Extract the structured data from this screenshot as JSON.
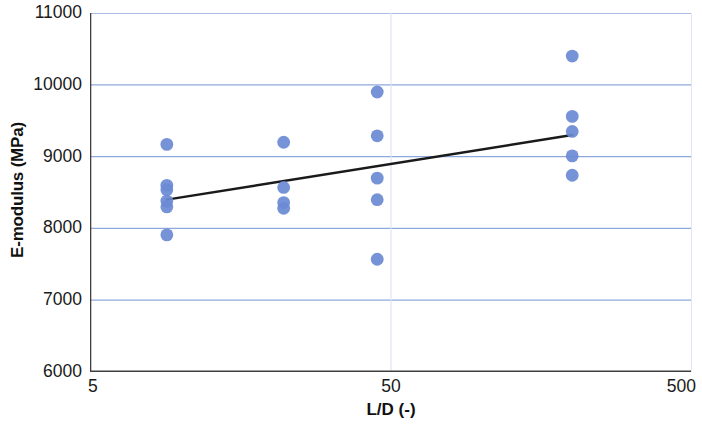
{
  "chart_data": {
    "type": "scatter",
    "title": "",
    "xlabel": "L/D (-)",
    "ylabel": "E-modulus (MPa)",
    "xscale": "log",
    "yscale": "linear",
    "xlim": [
      5,
      500
    ],
    "ylim": [
      6000,
      11000
    ],
    "x_ticks": [
      5,
      50,
      500
    ],
    "x_tick_labels": [
      "5",
      "50",
      "500"
    ],
    "y_ticks": [
      6000,
      7000,
      8000,
      9000,
      10000,
      11000
    ],
    "y_tick_labels": [
      "6000",
      "7000",
      "8000",
      "9000",
      "10000",
      "11000"
    ],
    "grid": "horizontal",
    "legend": "none",
    "marker_color": "#6b8ad4",
    "trendline_color": "#1a1a1a",
    "gridline_color": "#8fa8dc",
    "axis_color": "#3f3f3f",
    "series": [
      {
        "name": "E-modulus measurements",
        "marker": "circle",
        "points": [
          {
            "x": 9.0,
            "y": 9170
          },
          {
            "x": 9.0,
            "y": 8600
          },
          {
            "x": 9.0,
            "y": 8540
          },
          {
            "x": 9.0,
            "y": 8380
          },
          {
            "x": 9.0,
            "y": 8300
          },
          {
            "x": 9.0,
            "y": 7910
          },
          {
            "x": 22.0,
            "y": 9200
          },
          {
            "x": 22.0,
            "y": 8570
          },
          {
            "x": 22.0,
            "y": 8360
          },
          {
            "x": 22.0,
            "y": 8280
          },
          {
            "x": 45.0,
            "y": 9900
          },
          {
            "x": 45.0,
            "y": 9290
          },
          {
            "x": 45.0,
            "y": 8700
          },
          {
            "x": 45.0,
            "y": 8400
          },
          {
            "x": 45.0,
            "y": 7570
          },
          {
            "x": 200.0,
            "y": 10400
          },
          {
            "x": 200.0,
            "y": 9560
          },
          {
            "x": 200.0,
            "y": 9350
          },
          {
            "x": 200.0,
            "y": 9010
          },
          {
            "x": 200.0,
            "y": 8740
          }
        ]
      }
    ],
    "trendline": {
      "name": "linear fit (log x)",
      "start": {
        "x": 9.0,
        "y": 8400
      },
      "end": {
        "x": 200.0,
        "y": 9300
      }
    }
  }
}
